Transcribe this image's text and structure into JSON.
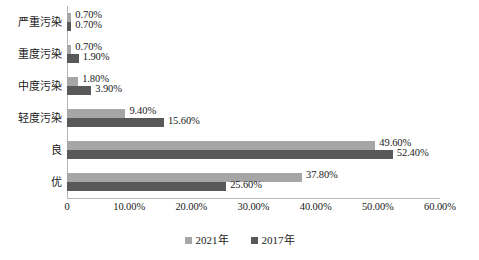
{
  "chart_data": {
    "type": "bar",
    "orientation": "horizontal",
    "title": "",
    "xlabel": "",
    "ylabel": "",
    "categories": [
      "优",
      "良",
      "轻度污染",
      "中度污染",
      "重度污染",
      "严重污染"
    ],
    "series": [
      {
        "name": "2021年",
        "color": "#a6a6a6",
        "values": [
          37.8,
          49.6,
          9.4,
          1.8,
          0.7,
          0.7
        ],
        "labels": [
          "37.80%",
          "49.60%",
          "9.40%",
          "1.80%",
          "0.70%",
          "0.70%"
        ]
      },
      {
        "name": "2017年",
        "color": "#595959",
        "values": [
          25.6,
          52.4,
          15.6,
          3.9,
          1.9,
          0.7
        ],
        "labels": [
          "25.60%",
          "52.40%",
          "15.60%",
          "3.90%",
          "1.90%",
          "0.70%"
        ]
      }
    ],
    "xlim": [
      0,
      60
    ],
    "xticks": [
      0,
      10,
      20,
      30,
      40,
      50,
      60
    ],
    "xticklabels": [
      "0",
      "10.00%",
      "20.00%",
      "30.00%",
      "40.00%",
      "50.00%",
      "60.00%"
    ],
    "grid": false,
    "legend_position": "bottom"
  },
  "axis": {
    "ticks": [
      {
        "label": "0",
        "value": 0
      },
      {
        "label": "10.00%",
        "value": 10
      },
      {
        "label": "20.00%",
        "value": 20
      },
      {
        "label": "30.00%",
        "value": 30
      },
      {
        "label": "40.00%",
        "value": 40
      },
      {
        "label": "50.00%",
        "value": 50
      },
      {
        "label": "60.00%",
        "value": 60
      }
    ]
  },
  "rows": [
    {
      "category": "严重污染",
      "s2021": {
        "value": 0.7,
        "label": "0.70%"
      },
      "s2017": {
        "value": 0.7,
        "label": "0.70%"
      }
    },
    {
      "category": "重度污染",
      "s2021": {
        "value": 0.7,
        "label": "0.70%"
      },
      "s2017": {
        "value": 1.9,
        "label": "1.90%"
      }
    },
    {
      "category": "中度污染",
      "s2021": {
        "value": 1.8,
        "label": "1.80%"
      },
      "s2017": {
        "value": 3.9,
        "label": "3.90%"
      }
    },
    {
      "category": "轻度污染",
      "s2021": {
        "value": 9.4,
        "label": "9.40%"
      },
      "s2017": {
        "value": 15.6,
        "label": "15.60%"
      }
    },
    {
      "category": "良",
      "s2021": {
        "value": 49.6,
        "label": "49.60%"
      },
      "s2017": {
        "value": 52.4,
        "label": "52.40%"
      }
    },
    {
      "category": "优",
      "s2021": {
        "value": 37.8,
        "label": "37.80%"
      },
      "s2017": {
        "value": 25.6,
        "label": "25.60%"
      }
    }
  ],
  "legend": {
    "items": [
      {
        "label": "2021年",
        "color": "#a6a6a6"
      },
      {
        "label": "2017年",
        "color": "#595959"
      }
    ]
  },
  "colors": {
    "series_2021": "#a6a6a6",
    "series_2017": "#595959",
    "axis": "#b8b8b8",
    "text": "#1a1a1a",
    "background": "#ffffff"
  }
}
